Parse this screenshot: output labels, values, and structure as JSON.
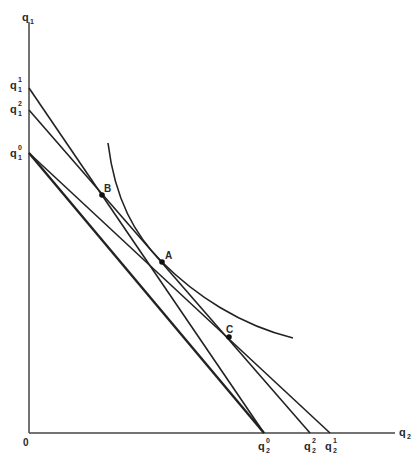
{
  "diagram": {
    "axes": {
      "y_axis_label": {
        "base": "q",
        "sub": "1"
      },
      "x_axis_label": {
        "base": "q",
        "sub": "2"
      },
      "origin_label": "0"
    },
    "y_intercepts": [
      {
        "base": "q",
        "sub": "1",
        "sup": "1"
      },
      {
        "base": "q",
        "sub": "1",
        "sup": "2"
      },
      {
        "base": "q",
        "sub": "1",
        "sup": "0"
      }
    ],
    "x_intercepts": [
      {
        "base": "q",
        "sub": "2",
        "sup": "0"
      },
      {
        "base": "q",
        "sub": "2",
        "sup": "2"
      },
      {
        "base": "q",
        "sub": "2",
        "sup": "1"
      }
    ],
    "points": [
      {
        "label": "A"
      },
      {
        "label": "B"
      },
      {
        "label": "C"
      }
    ],
    "colors": {
      "ink": "#222222",
      "background": "#ffffff"
    }
  }
}
